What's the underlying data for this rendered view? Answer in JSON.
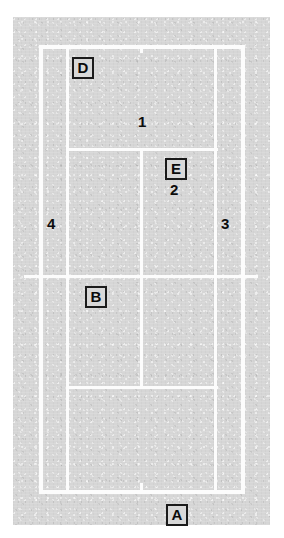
{
  "diagram": {
    "type": "tennis-court-plan",
    "title": "",
    "colors": {
      "surface": "#d6d6d6",
      "lines": "#fcfcfc",
      "label_text": "#0b0b0b",
      "label_border": "#1b1b1b",
      "page_background": "#ffffff"
    },
    "surface": {
      "x": 13,
      "y": 17,
      "width": 257,
      "height": 508
    },
    "court_lines": [
      {
        "name": "top-baseline",
        "orient": "h",
        "x": 39,
        "y": 45,
        "length": 206
      },
      {
        "name": "bottom-baseline",
        "orient": "h",
        "x": 39,
        "y": 490,
        "length": 206
      },
      {
        "name": "left-doubles-sideline",
        "orient": "v",
        "x": 39,
        "y": 45,
        "length": 449
      },
      {
        "name": "right-doubles-sideline",
        "orient": "v",
        "x": 241,
        "y": 45,
        "length": 449
      },
      {
        "name": "left-singles-sideline",
        "orient": "v",
        "x": 66,
        "y": 45,
        "length": 449
      },
      {
        "name": "right-singles-sideline",
        "orient": "v",
        "x": 214,
        "y": 45,
        "length": 449
      },
      {
        "name": "net",
        "orient": "h",
        "x": 24,
        "y": 275,
        "length": 234
      },
      {
        "name": "top-service-line",
        "orient": "h",
        "x": 66,
        "y": 148,
        "length": 152
      },
      {
        "name": "bottom-service-line",
        "orient": "h",
        "x": 66,
        "y": 386,
        "length": 152
      },
      {
        "name": "center-service-line",
        "orient": "v",
        "x": 140,
        "y": 148,
        "length": 241
      },
      {
        "name": "top-center-mark",
        "orient": "v",
        "x": 140,
        "y": 45,
        "length": 8
      },
      {
        "name": "bottom-center-mark",
        "orient": "v",
        "x": 140,
        "y": 483,
        "length": 9
      }
    ],
    "labels": {
      "boxed": [
        {
          "id": "label-d",
          "text": "D",
          "x": 72,
          "y": 57
        },
        {
          "id": "label-e",
          "text": "E",
          "x": 165,
          "y": 158
        },
        {
          "id": "label-b",
          "text": "B",
          "x": 85,
          "y": 286
        },
        {
          "id": "label-a",
          "text": "A",
          "x": 166,
          "y": 504
        }
      ],
      "numbers": [
        {
          "id": "number-1",
          "text": "1",
          "x": 138,
          "y": 114
        },
        {
          "id": "number-2",
          "text": "2",
          "x": 170,
          "y": 182
        },
        {
          "id": "number-3",
          "text": "3",
          "x": 221,
          "y": 216
        },
        {
          "id": "number-4",
          "text": "4",
          "x": 47,
          "y": 216
        }
      ]
    }
  }
}
